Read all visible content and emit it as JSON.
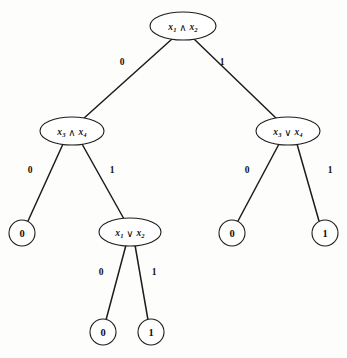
{
  "figure": {
    "background_color": "#fdfdfc",
    "ink_color": "#1d1d1d",
    "width": 347,
    "height": 358
  },
  "nodes": [
    {
      "id": "root",
      "kind": "internal",
      "shape": "ellipse",
      "label": "x1 ∧ x2",
      "var_a": "x",
      "sub_a": "1",
      "operator": "∧",
      "var_b": "x",
      "sub_b": "2",
      "cx": 183,
      "cy": 26,
      "rx": 33,
      "ry": 14
    },
    {
      "id": "left-internal",
      "kind": "internal",
      "shape": "ellipse",
      "label": "x3 ∧ x4",
      "var_a": "x",
      "sub_a": "3",
      "operator": "∧",
      "var_b": "x",
      "sub_b": "4",
      "cx": 72,
      "cy": 131,
      "rx": 32,
      "ry": 14
    },
    {
      "id": "right-internal",
      "kind": "internal",
      "shape": "ellipse",
      "label": "x3 ∨ x4",
      "var_a": "x",
      "sub_a": "3",
      "operator": "∨",
      "var_b": "x",
      "sub_b": "4",
      "cx": 288,
      "cy": 131,
      "rx": 32,
      "ry": 14
    },
    {
      "id": "mid-internal",
      "kind": "internal",
      "shape": "ellipse",
      "label": "x1 ∨ x2",
      "var_a": "x",
      "sub_a": "1",
      "operator": "∨",
      "var_b": "x",
      "sub_b": "2",
      "cx": 130,
      "cy": 232,
      "rx": 31,
      "ry": 14
    },
    {
      "id": "leaf-left-0",
      "kind": "leaf",
      "shape": "circle",
      "label": "0",
      "cx": 22,
      "cy": 233,
      "r": 13
    },
    {
      "id": "leaf-right-0",
      "kind": "leaf",
      "shape": "circle",
      "label": "0",
      "cx": 232,
      "cy": 233,
      "r": 13
    },
    {
      "id": "leaf-right-1",
      "kind": "leaf",
      "shape": "circle",
      "label": "1",
      "cx": 325,
      "cy": 233,
      "r": 13
    },
    {
      "id": "leaf-bottom-0",
      "kind": "leaf",
      "shape": "circle",
      "label": "0",
      "cx": 103,
      "cy": 332,
      "r": 13
    },
    {
      "id": "leaf-bottom-1",
      "kind": "leaf",
      "shape": "circle",
      "label": "1",
      "cx": 151,
      "cy": 332,
      "r": 13
    }
  ],
  "edges": [
    {
      "id": "root-to-left",
      "from": "root",
      "to": "left-internal",
      "label": "0",
      "x1": 172,
      "y1": 39,
      "x2": 83,
      "y2": 119,
      "lx": 122,
      "ly": 62
    },
    {
      "id": "root-to-right",
      "from": "root",
      "to": "right-internal",
      "label": "1",
      "x1": 194,
      "y1": 39,
      "x2": 277,
      "y2": 119,
      "lx": 222,
      "ly": 62
    },
    {
      "id": "left-to-leaf0",
      "from": "left-internal",
      "to": "leaf-left-0",
      "label": "0",
      "x1": 63,
      "y1": 144,
      "x2": 28,
      "y2": 221,
      "lx": 30,
      "ly": 170
    },
    {
      "id": "left-to-mid",
      "from": "left-internal",
      "to": "mid-internal",
      "label": "1",
      "x1": 82,
      "y1": 144,
      "x2": 124,
      "y2": 219,
      "lx": 112,
      "ly": 170
    },
    {
      "id": "right-to-leaf0",
      "from": "right-internal",
      "to": "leaf-right-0",
      "label": "0",
      "x1": 279,
      "y1": 144,
      "x2": 238,
      "y2": 221,
      "lx": 247,
      "ly": 170
    },
    {
      "id": "right-to-leaf1",
      "from": "right-internal",
      "to": "leaf-right-1",
      "label": "1",
      "x1": 297,
      "y1": 144,
      "x2": 319,
      "y2": 221,
      "lx": 330,
      "ly": 170
    },
    {
      "id": "mid-to-leaf0",
      "from": "mid-internal",
      "to": "leaf-bottom-0",
      "label": "0",
      "x1": 126,
      "y1": 245,
      "x2": 106,
      "y2": 320,
      "lx": 101,
      "ly": 272
    },
    {
      "id": "mid-to-leaf1",
      "from": "mid-internal",
      "to": "leaf-bottom-1",
      "label": "1",
      "x1": 135,
      "y1": 245,
      "x2": 148,
      "y2": 320,
      "lx": 154,
      "ly": 272
    }
  ]
}
